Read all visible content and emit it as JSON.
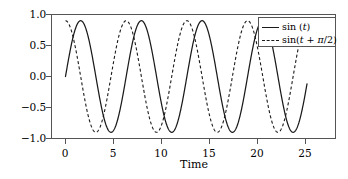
{
  "chart_data": {
    "type": "line",
    "title": "",
    "xlabel": "Time",
    "ylabel": "",
    "xlim": [
      -1.5,
      28.0
    ],
    "ylim": [
      -1.12,
      1.12
    ],
    "grid": false,
    "legend_position": "upper right",
    "xticks": [
      0,
      5,
      10,
      15,
      20,
      25
    ],
    "xticklabels": [
      "0",
      "5",
      "10",
      "15",
      "20",
      "25"
    ],
    "yticks": [
      1.0,
      0.5,
      0.0,
      -0.5,
      -1.0
    ],
    "yticklabels": [
      "1.0",
      "0.5",
      "0.0",
      "-0.5",
      "-1.0"
    ],
    "x_domain": [
      0,
      25
    ],
    "series": [
      {
        "name": "sin (t)",
        "label_plain": "sin (t)",
        "linestyle": "solid",
        "color": "#1a1a1a",
        "formula": "sin(t)",
        "amplitude": 1.0,
        "phase": 0.0,
        "period": 6.283,
        "samples_x": [
          0,
          1.5708,
          3.1416,
          4.7124,
          6.2832,
          7.854,
          9.4248,
          10.9956,
          12.5664,
          14.1372,
          15.708,
          17.2788,
          18.8496,
          20.4204,
          21.9911,
          23.5619,
          25.0
        ],
        "samples_y": [
          0.0,
          1.0,
          0.0,
          -1.0,
          0.0,
          1.0,
          0.0,
          -1.0,
          0.0,
          1.0,
          0.0,
          -1.0,
          0.0,
          1.0,
          0.0,
          -1.0,
          -0.132
        ]
      },
      {
        "name": "sin(t + π/2)",
        "label_plain": "sin(t + π/2)",
        "linestyle": "dashed",
        "color": "#1a1a1a",
        "formula": "sin(t + pi/2)",
        "amplitude": 1.0,
        "phase": 1.5708,
        "period": 6.283,
        "samples_x": [
          0,
          1.5708,
          3.1416,
          4.7124,
          6.2832,
          7.854,
          9.4248,
          10.9956,
          12.5664,
          14.1372,
          15.708,
          17.2788,
          18.8496,
          20.4204,
          21.9911,
          23.5619,
          25.0
        ],
        "samples_y": [
          1.0,
          0.0,
          -1.0,
          0.0,
          1.0,
          0.0,
          -1.0,
          0.0,
          1.0,
          0.0,
          -1.0,
          0.0,
          1.0,
          0.0,
          -1.0,
          0.0,
          0.991
        ]
      }
    ]
  },
  "legend": {
    "entries": [
      {
        "label_prefix": "sin (",
        "label_var": "t",
        "label_suffix": ")"
      },
      {
        "label_prefix": "sin(",
        "label_var": "t",
        "label_mid": " + ",
        "label_pi": "π",
        "label_suffix": "/2)"
      }
    ]
  },
  "axis": {
    "xlabel": "Time",
    "xticklabels": [
      "0",
      "5",
      "10",
      "15",
      "20",
      "25"
    ],
    "yticklabels": [
      "1.0",
      "0.5",
      "0.0",
      "−0.5",
      "−1.0"
    ]
  }
}
